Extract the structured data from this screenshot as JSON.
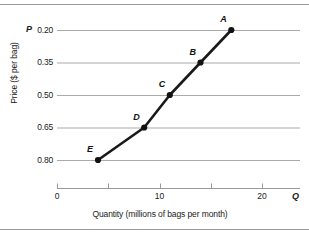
{
  "figure": {
    "top_rule": "",
    "bottom_rule": ""
  },
  "axes": {
    "y_axis_title": "Price ($ per bag)",
    "x_axis_title": "Quantity (millions of bags per month)",
    "y_axis_symbol": "P",
    "x_axis_symbol": "Q",
    "y_ticks": [
      "0.80",
      "0.65",
      "0.50",
      "0.35",
      "0.20"
    ],
    "x_ticks": [
      "0",
      "10",
      "20"
    ],
    "gridline_color": "#aaaaaa",
    "line_color": "#1a1a1a"
  },
  "chart_data": {
    "type": "line",
    "title": "",
    "subtitle": "",
    "xlabel": "Quantity (millions of bags per month)",
    "ylabel": "Price ($ per bag)",
    "xlim": [
      0,
      24
    ],
    "ylim": [
      0.125,
      0.875
    ],
    "grid": "horizontal",
    "legend": "none",
    "x_tick_values": [
      0,
      10,
      20
    ],
    "x_minor_tick_values": [
      5,
      15
    ],
    "y_tick_values": [
      0.2,
      0.35,
      0.5,
      0.65,
      0.8
    ],
    "series": [
      {
        "name": "Supply",
        "marker": "filled-circle",
        "points": [
          {
            "label": "E",
            "x": 4.0,
            "y": 0.2
          },
          {
            "label": "D",
            "x": 8.5,
            "y": 0.35
          },
          {
            "label": "C",
            "x": 11.0,
            "y": 0.5
          },
          {
            "label": "B",
            "x": 14.0,
            "y": 0.65
          },
          {
            "label": "A",
            "x": 17.0,
            "y": 0.8
          }
        ]
      }
    ],
    "annotations": [
      {
        "text": "A",
        "x": 17.0,
        "y": 0.8,
        "position": "upper-left"
      },
      {
        "text": "B",
        "x": 14.0,
        "y": 0.65,
        "position": "upper-left"
      },
      {
        "text": "C",
        "x": 11.0,
        "y": 0.5,
        "position": "upper-left"
      },
      {
        "text": "D",
        "x": 8.5,
        "y": 0.35,
        "position": "upper-left"
      },
      {
        "text": "E",
        "x": 4.0,
        "y": 0.2,
        "position": "upper-left"
      }
    ]
  }
}
